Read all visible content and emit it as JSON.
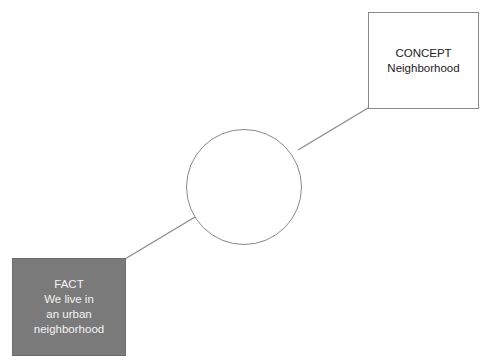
{
  "diagram": {
    "concept_box": {
      "title": "CONCEPT",
      "lines": [
        "Neighborhood"
      ]
    },
    "fact_box": {
      "title": "FACT",
      "lines": [
        "We live in",
        "an urban",
        "neighborhood"
      ]
    },
    "center_node": {
      "label": ""
    },
    "colors": {
      "fact_fill": "#7a7a7a",
      "stroke": "#8a8a8a",
      "background": "#ffffff"
    }
  }
}
